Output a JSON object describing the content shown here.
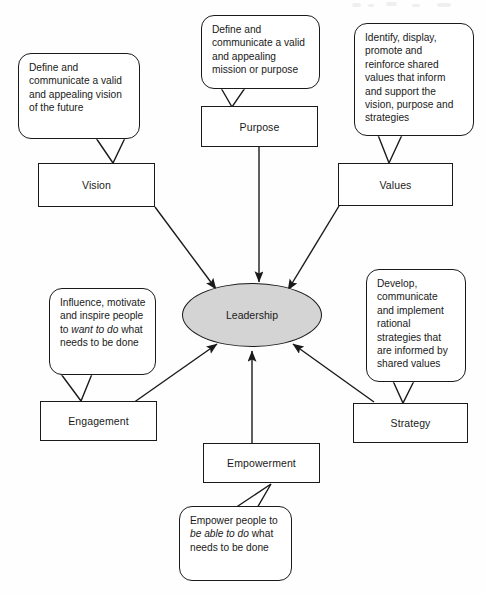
{
  "diagram": {
    "hub": {
      "label": "Leadership",
      "fill": "#d4d4d4",
      "stroke": "#1a1a1a"
    },
    "nodes": [
      {
        "id": "vision",
        "label": "Vision"
      },
      {
        "id": "purpose",
        "label": "Purpose"
      },
      {
        "id": "values",
        "label": "Values"
      },
      {
        "id": "engagement",
        "label": "Engagement"
      },
      {
        "id": "strategy",
        "label": "Strategy"
      },
      {
        "id": "empowerment",
        "label": "Empowerment"
      }
    ],
    "callouts": [
      {
        "id": "vision-callout",
        "for": "vision",
        "text": "Define and communicate a valid and appealing vision of the future"
      },
      {
        "id": "purpose-callout",
        "for": "purpose",
        "text": "Define and communicate a valid and appealing mission or purpose"
      },
      {
        "id": "values-callout",
        "for": "values",
        "text": "Identify, display, promote and reinforce shared values that inform and support the vision, purpose and strategies"
      },
      {
        "id": "engagement-callout",
        "for": "engagement",
        "text_before": "Influence, motivate and inspire people to ",
        "text_emphasis": "want to do",
        "text_after": " what needs to be done"
      },
      {
        "id": "strategy-callout",
        "for": "strategy",
        "text": "Develop, communicate and implement rational strategies that are informed by shared values"
      },
      {
        "id": "empowerment-callout",
        "for": "empowerment",
        "text_before": "Empower people to ",
        "text_emphasis": "be able to do",
        "text_after": " what needs to be done"
      }
    ],
    "connections": [
      {
        "from": "vision",
        "to": "hub",
        "arrow": true
      },
      {
        "from": "purpose",
        "to": "hub",
        "arrow": true
      },
      {
        "from": "values",
        "to": "hub",
        "arrow": true
      },
      {
        "from": "engagement",
        "to": "hub",
        "arrow": true
      },
      {
        "from": "strategy",
        "to": "hub",
        "arrow": true
      },
      {
        "from": "empowerment",
        "to": "hub",
        "arrow": true
      }
    ]
  }
}
